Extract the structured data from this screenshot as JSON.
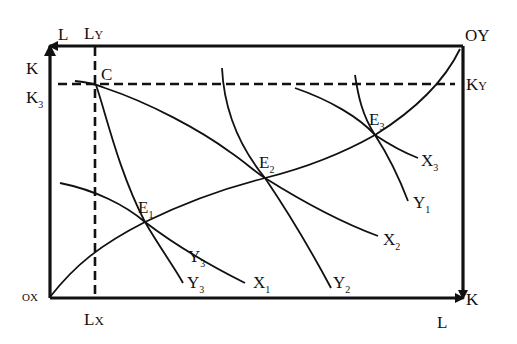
{
  "diagram": {
    "type": "edgeworth-production-box",
    "origins": {
      "x_origin": "OX",
      "y_origin": "OY"
    },
    "axes": {
      "top_left_L": "L",
      "left_top_K": "K",
      "bottom_right_K": "K",
      "bottom_right_L": "L"
    },
    "reference_lines": {
      "vertical_top": "L",
      "vertical_top_sub": "Y",
      "vertical_bottom": "L",
      "vertical_bottom_sub": "X",
      "horizontal_left": "K",
      "horizontal_left_sub": "3",
      "horizontal_right": "K",
      "horizontal_right_sub": "Y"
    },
    "point_c": "C",
    "equilibria": [
      {
        "label": "E",
        "sub": "1"
      },
      {
        "label": "E",
        "sub": "2"
      },
      {
        "label": "E",
        "sub": "3"
      }
    ],
    "x_isoquants": [
      {
        "label": "X",
        "sub": "1"
      },
      {
        "label": "X",
        "sub": "2"
      },
      {
        "label": "X",
        "sub": "3"
      }
    ],
    "y_isoquants": [
      {
        "label": "Y",
        "sub": "3"
      },
      {
        "label": "Y",
        "sub": "3"
      },
      {
        "label": "Y",
        "sub": "2"
      },
      {
        "label": "Y",
        "sub": "1"
      }
    ],
    "colors": {
      "line": "#111111",
      "background": "#ffffff"
    }
  }
}
